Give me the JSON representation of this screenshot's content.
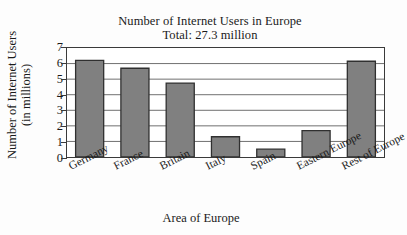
{
  "chart_data": {
    "type": "bar",
    "title": "Number of Internet Users in Europe",
    "subtitle": "Total: 27.3 million",
    "xlabel": "Area of Europe",
    "ylabel_line1": "Number of Internet Users",
    "ylabel_line2": "(in millions)",
    "categories": [
      "Germany",
      "France",
      "Britain",
      "Italy",
      "Spain",
      "Eastern Europe",
      "Rest of Europe"
    ],
    "values": [
      6.2,
      5.7,
      4.75,
      1.3,
      0.5,
      1.7,
      6.15
    ],
    "ylim": [
      0,
      7
    ],
    "ytick_labels": [
      "0",
      "1",
      "2",
      "3",
      "4",
      "5",
      "6",
      "7"
    ],
    "ytick_values": [
      0,
      1,
      2,
      3,
      4,
      5,
      6,
      7
    ],
    "grid": "horizontal",
    "legend": "none",
    "bar_fill_color": "#808080",
    "bar_edge_color": "#303030",
    "axis_color": "#3a3a3a",
    "grid_color": "#707070",
    "plot_background": "#ffffff",
    "figure_background": "#fdfdfd"
  }
}
